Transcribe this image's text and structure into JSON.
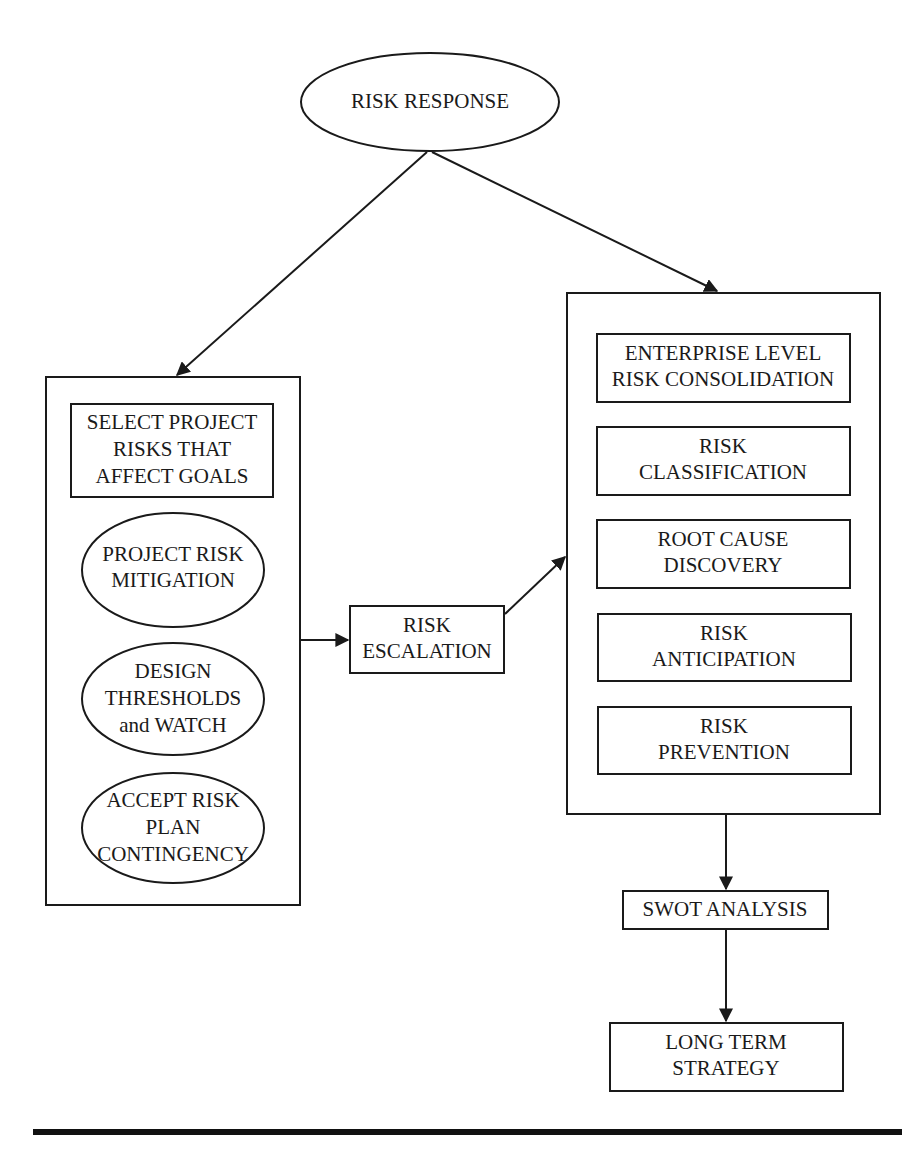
{
  "diagram": {
    "title_node": {
      "label": "RISK RESPONSE",
      "shape": "ellipse"
    },
    "left_group": {
      "items": [
        {
          "lines": [
            "SELECT PROJECT",
            "RISKS THAT",
            "AFFECT GOALS"
          ],
          "shape": "rectangle"
        },
        {
          "lines": [
            "PROJECT RISK",
            "MITIGATION"
          ],
          "shape": "ellipse"
        },
        {
          "lines": [
            "DESIGN",
            "THRESHOLDS",
            "and WATCH"
          ],
          "shape": "ellipse"
        },
        {
          "lines": [
            "ACCEPT RISK",
            "PLAN",
            "CONTINGENCY"
          ],
          "shape": "ellipse"
        }
      ]
    },
    "middle_node": {
      "lines": [
        "RISK",
        "ESCALATION"
      ],
      "shape": "rectangle"
    },
    "right_group": {
      "items": [
        {
          "lines": [
            "ENTERPRISE LEVEL",
            "RISK CONSOLIDATION"
          ],
          "shape": "rectangle"
        },
        {
          "lines": [
            "RISK",
            "CLASSIFICATION"
          ],
          "shape": "rectangle"
        },
        {
          "lines": [
            "ROOT CAUSE",
            "DISCOVERY"
          ],
          "shape": "rectangle"
        },
        {
          "lines": [
            "RISK",
            "ANTICIPATION"
          ],
          "shape": "rectangle"
        },
        {
          "lines": [
            "RISK",
            "PREVENTION"
          ],
          "shape": "rectangle"
        }
      ]
    },
    "swot_node": {
      "label": "SWOT ANALYSIS",
      "shape": "rectangle"
    },
    "strategy_node": {
      "lines": [
        "LONG TERM",
        "STRATEGY"
      ],
      "shape": "rectangle"
    },
    "edges": [
      {
        "from": "RISK RESPONSE",
        "to": "left_group"
      },
      {
        "from": "RISK RESPONSE",
        "to": "right_group"
      },
      {
        "from": "left_group",
        "to": "RISK ESCALATION"
      },
      {
        "from": "RISK ESCALATION",
        "to": "right_group"
      },
      {
        "from": "right_group",
        "to": "SWOT ANALYSIS"
      },
      {
        "from": "SWOT ANALYSIS",
        "to": "LONG TERM STRATEGY"
      }
    ],
    "colors": {
      "stroke": "#1a1a1a",
      "background": "#ffffff"
    }
  }
}
